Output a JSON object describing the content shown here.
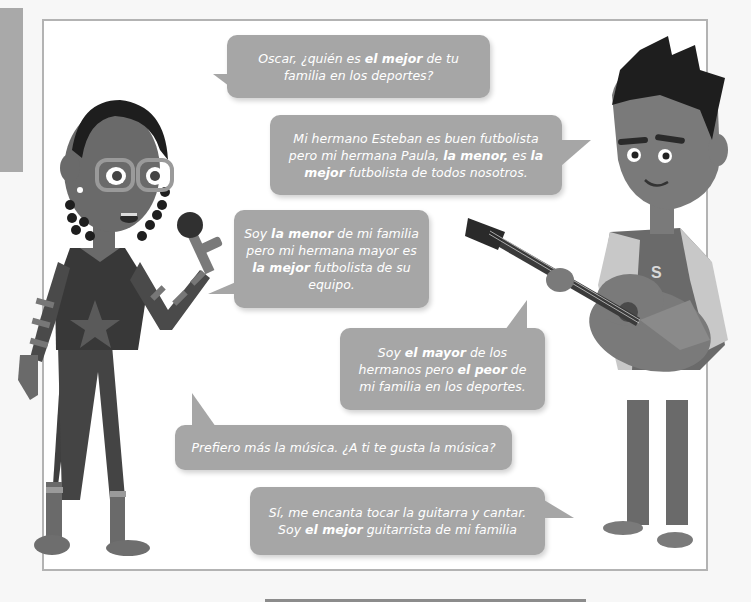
{
  "page": {
    "side_tab_color": "#a9a9a9",
    "frame_border_color": "#b3b3b3",
    "bubble_color": "#a6a6a6",
    "bubble_text_color": "#ffffff"
  },
  "characters": [
    {
      "id": "girl",
      "description": "girl with braids, glasses, holding a microphone",
      "side": "left"
    },
    {
      "id": "oscar",
      "description": "boy with spiky hair holding a guitar, letter S on jacket",
      "side": "right",
      "jacket_letter": "S"
    }
  ],
  "dialogue": [
    {
      "speaker": "girl",
      "parts": [
        {
          "t": "Oscar, ¿quién es ",
          "b": false
        },
        {
          "t": "el mejor",
          "b": true
        },
        {
          "t": " de tu familia en los deportes?",
          "b": false
        }
      ]
    },
    {
      "speaker": "oscar",
      "parts": [
        {
          "t": "Mi hermano Esteban es buen futbolista pero mi hermana Paula, ",
          "b": false
        },
        {
          "t": "la menor,",
          "b": true
        },
        {
          "t": " es ",
          "b": false
        },
        {
          "t": "la mejor",
          "b": true
        },
        {
          "t": " futbolista de todos nosotros.",
          "b": false
        }
      ]
    },
    {
      "speaker": "girl",
      "parts": [
        {
          "t": "Soy ",
          "b": false
        },
        {
          "t": "la menor",
          "b": true
        },
        {
          "t": " de mi familia pero mi hermana mayor es ",
          "b": false
        },
        {
          "t": "la mejor",
          "b": true
        },
        {
          "t": " futbolista de su equipo.",
          "b": false
        }
      ]
    },
    {
      "speaker": "oscar",
      "parts": [
        {
          "t": "Soy ",
          "b": false
        },
        {
          "t": "el mayor",
          "b": true
        },
        {
          "t": " de los hermanos pero ",
          "b": false
        },
        {
          "t": "el peor",
          "b": true
        },
        {
          "t": " de mi familia en los deportes.",
          "b": false
        }
      ]
    },
    {
      "speaker": "girl",
      "parts": [
        {
          "t": "Prefiero más la música. ¿A ti te gusta la música?",
          "b": false
        }
      ]
    },
    {
      "speaker": "oscar",
      "parts": [
        {
          "t": "Sí, me encanta tocar la guitarra y cantar. Soy ",
          "b": false
        },
        {
          "t": "el mejor",
          "b": true
        },
        {
          "t": " guitarrista de mi familia",
          "b": false
        }
      ]
    }
  ]
}
